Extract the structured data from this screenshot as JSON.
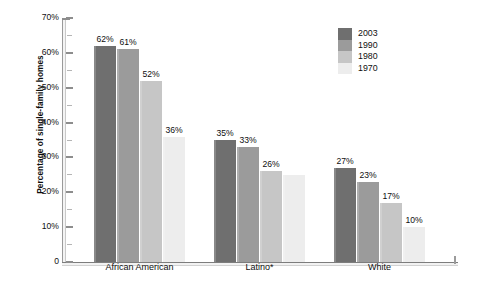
{
  "chart_data": {
    "type": "bar",
    "title": "",
    "xlabel": "",
    "ylabel": "Percentage of single-family homes",
    "ylim": [
      0,
      70
    ],
    "ytick_labels": [
      "0",
      "10%",
      "20%",
      "30%",
      "40%",
      "50%",
      "60%",
      "70%"
    ],
    "ytick_values": [
      0,
      10,
      20,
      30,
      40,
      50,
      60,
      70
    ],
    "grid": false,
    "legend_position": "top-right",
    "categories": [
      "African American",
      "Latino*",
      "White"
    ],
    "series": [
      {
        "name": "2003",
        "color": "#6f6f6f",
        "values": [
          62,
          35,
          27
        ],
        "labels": [
          "62%",
          "35%",
          "27%"
        ]
      },
      {
        "name": "1990",
        "color": "#9b9b9b",
        "values": [
          61,
          33,
          23
        ],
        "labels": [
          "61%",
          "33%",
          "23%"
        ]
      },
      {
        "name": "1980",
        "color": "#c6c6c6",
        "values": [
          52,
          26,
          17
        ],
        "labels": [
          "52%",
          "26%",
          "17%"
        ]
      },
      {
        "name": "1970",
        "color": "#ededed",
        "values": [
          36,
          25,
          10
        ],
        "labels": [
          "36%",
          "",
          "10%"
        ]
      }
    ]
  },
  "legend": {
    "entries": [
      {
        "label": "2003",
        "color": "#6f6f6f"
      },
      {
        "label": "1990",
        "color": "#9b9b9b"
      },
      {
        "label": "1980",
        "color": "#c6c6c6"
      },
      {
        "label": "1970",
        "color": "#ededed"
      }
    ]
  },
  "axes": {
    "y_title": "Percentage of single-family homes",
    "y_labels": [
      "70%",
      "60%",
      "50%",
      "40%",
      "30%",
      "20%",
      "10%",
      "0"
    ],
    "x_labels": [
      "African American",
      "Latino*",
      "White"
    ]
  }
}
